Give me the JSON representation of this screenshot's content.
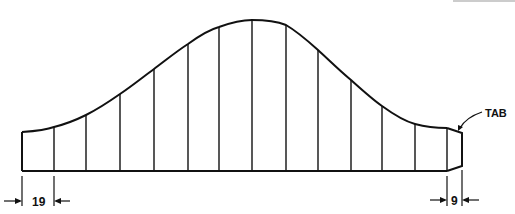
{
  "diagram": {
    "type": "panel-profile",
    "stroke_color": "#111111",
    "outline": {
      "baseline_y": 171,
      "station_x": [
        22,
        54,
        86,
        120,
        154,
        188,
        219,
        252,
        286,
        318,
        351,
        382,
        415,
        447
      ],
      "curve_y": [
        132,
        127,
        115,
        94,
        69,
        44,
        27,
        20,
        25,
        50,
        80,
        106,
        124,
        128
      ]
    },
    "tab": {
      "label": "TAB",
      "x_start": 447,
      "x_end": 462
    },
    "dimensions": [
      {
        "label": "19",
        "from_x": 22,
        "to_x": 54
      },
      {
        "label": "9",
        "from_x": 447,
        "to_x": 462
      }
    ]
  }
}
